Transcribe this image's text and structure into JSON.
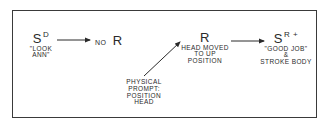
{
  "diagram": {
    "type": "behavioral-sequence",
    "nodes": {
      "sd": {
        "symbol": "S",
        "superscript": "D",
        "caption_line1": "\"LOOK",
        "caption_line2": "ANN\""
      },
      "no_r": {
        "prefix": "NO",
        "symbol": "R"
      },
      "prompt": {
        "line1": "PHYSICAL",
        "line2": "PROMPT:",
        "line3": "POSITION",
        "line4": "HEAD"
      },
      "r": {
        "symbol": "R",
        "line1": "HEAD MOVED",
        "line2": "TO UP",
        "line3": "POSITION"
      },
      "sr": {
        "symbol": "S",
        "superscript": "R +",
        "line1": "\"GOOD JOB\"",
        "line2": "&",
        "line3": "STROKE BODY"
      }
    },
    "edges": [
      {
        "from": "sd",
        "to": "no_r"
      },
      {
        "from": "prompt",
        "to": "r"
      },
      {
        "from": "r",
        "to": "sr"
      }
    ],
    "colors": {
      "ink": "#2a2a2a",
      "frame": "#3a3a3a",
      "background": "#ffffff"
    }
  }
}
